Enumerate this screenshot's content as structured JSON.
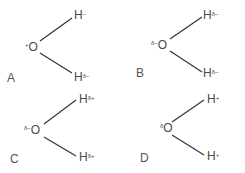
{
  "options": [
    {
      "label": "A",
      "oxygen": {
        "symbol": "O",
        "charge": "+"
      },
      "h_top": {
        "symbol": "H",
        "charge": "−"
      },
      "h_bottom": {
        "symbol": "H",
        "charge": "δ−"
      }
    },
    {
      "label": "B",
      "oxygen": {
        "symbol": "O",
        "charge": "δ−"
      },
      "h_top": {
        "symbol": "H",
        "charge": "δ−"
      },
      "h_bottom": {
        "symbol": "H",
        "charge": "δ−"
      }
    },
    {
      "label": "C",
      "oxygen": {
        "symbol": "O",
        "charge": "δ−"
      },
      "h_top": {
        "symbol": "H",
        "charge": "δ+"
      },
      "h_bottom": {
        "symbol": "H",
        "charge": "δ+"
      }
    },
    {
      "label": "D",
      "oxygen": {
        "symbol": "O",
        "charge": "δ"
      },
      "h_top": {
        "symbol": "H",
        "charge": "+"
      },
      "h_bottom": {
        "symbol": "H",
        "charge": "+"
      }
    }
  ],
  "colors": {
    "text": "#4a4a4a",
    "bond": "#333333",
    "background": "#ffffff"
  }
}
